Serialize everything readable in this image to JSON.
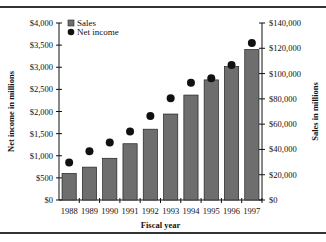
{
  "chart_data": {
    "type": "bar",
    "title": "",
    "xlabel": "Fiscal year",
    "ylabel_left": "Net income in millions",
    "ylabel_right": "Sales in millions",
    "categories": [
      "1988",
      "1989",
      "1990",
      "1991",
      "1992",
      "1993",
      "1994",
      "1995",
      "1996",
      "1997"
    ],
    "series": [
      {
        "name": "Sales",
        "type": "bar",
        "axis": "right",
        "color": "#6e6e6e",
        "values": [
          21000,
          26000,
          33000,
          44500,
          56000,
          68000,
          83000,
          95000,
          105500,
          119000
        ]
      },
      {
        "name": "Net income",
        "type": "scatter",
        "axis": "left",
        "color": "#111111",
        "values": [
          850,
          1100,
          1300,
          1550,
          1900,
          2300,
          2650,
          2750,
          3050,
          3550
        ]
      }
    ],
    "ylim_left": [
      0,
      4000
    ],
    "ylim_right": [
      0,
      140000
    ],
    "left_ticks": [
      "$0",
      "$500",
      "$1,000",
      "$1,500",
      "$2,000",
      "$2,500",
      "$3,000",
      "$3,500",
      "$4,000"
    ],
    "right_ticks": [
      "$0",
      "$20,000",
      "$40,000",
      "$60,000",
      "$80,000",
      "$100,000",
      "$120,000",
      "$140,000"
    ],
    "legend": {
      "position": "top-left",
      "entries": [
        "Sales",
        "Net income"
      ]
    },
    "grid": false
  }
}
